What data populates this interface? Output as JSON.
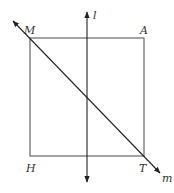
{
  "diagram": {
    "colors": {
      "stroke": "#555555",
      "line": "#222222",
      "text": "#333333"
    },
    "square": {
      "vertices": {
        "M": {
          "label": "M",
          "x": 30,
          "y": 38
        },
        "A": {
          "label": "A",
          "x": 144,
          "y": 38
        },
        "T": {
          "label": "T",
          "x": 144,
          "y": 156
        },
        "H": {
          "label": "H",
          "x": 30,
          "y": 156
        }
      }
    },
    "lines": {
      "l": {
        "label": "l",
        "description": "vertical line through the square, arrows both ends"
      },
      "m": {
        "label": "m",
        "description": "diagonal line through M and T, arrows both ends"
      }
    }
  }
}
